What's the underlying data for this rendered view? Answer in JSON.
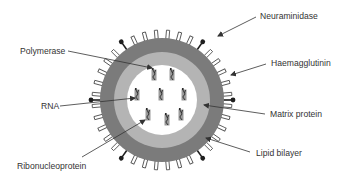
{
  "figure": {
    "colors": {
      "background": "#ffffff",
      "lipid_bilayer": "#7b7b7b",
      "matrix_protein": "#b4b4b4",
      "core": "#ffffff",
      "spike_outline": "#555555",
      "knob": "#1f1f1f",
      "rnp_box": "#9a9a9a",
      "rna_strand": "#2a2a2a",
      "arrow": "#333333",
      "text": "#333333"
    },
    "virion": {
      "cx": 162,
      "cy": 100,
      "outer_radius": 62,
      "matrix_radius": 48,
      "core_radius": 35,
      "haemagglutinin_count": 36,
      "neuraminidase_angles_deg": [
        -125,
        -55,
        0,
        55,
        125,
        180
      ]
    },
    "ribonucleoproteins": [
      {
        "x": 154,
        "y": 75
      },
      {
        "x": 172,
        "y": 75
      },
      {
        "x": 137,
        "y": 95
      },
      {
        "x": 161,
        "y": 95
      },
      {
        "x": 184,
        "y": 95
      },
      {
        "x": 148,
        "y": 115
      },
      {
        "x": 167,
        "y": 120
      },
      {
        "x": 181,
        "y": 115
      }
    ]
  },
  "labels": [
    {
      "id": "neuraminidase",
      "text": "Neuraminidase",
      "x": 260,
      "y": 11,
      "arrow": {
        "x1": 256,
        "y1": 17,
        "x2": 218,
        "y2": 36
      }
    },
    {
      "id": "polymerase",
      "text": "Polymerase",
      "x": 20,
      "y": 46,
      "arrow": {
        "x1": 68,
        "y1": 51,
        "x2": 152,
        "y2": 68
      }
    },
    {
      "id": "haemagglutinin",
      "text": "Haemagglutinin",
      "x": 271,
      "y": 58,
      "arrow": {
        "x1": 266,
        "y1": 64,
        "x2": 231,
        "y2": 75
      }
    },
    {
      "id": "rna",
      "text": "RNA",
      "x": 41,
      "y": 101,
      "arrow": {
        "x1": 60,
        "y1": 106,
        "x2": 135,
        "y2": 98
      }
    },
    {
      "id": "matrix-protein",
      "text": "Matrix protein",
      "x": 270,
      "y": 109,
      "arrow": {
        "x1": 265,
        "y1": 114,
        "x2": 204,
        "y2": 105
      }
    },
    {
      "id": "lipid-bilayer",
      "text": "Lipid bilayer",
      "x": 256,
      "y": 148,
      "arrow": {
        "x1": 250,
        "y1": 152,
        "x2": 206,
        "y2": 138
      }
    },
    {
      "id": "ribonucleoprotein",
      "text": "Ribonucleoprotein",
      "x": 17,
      "y": 161,
      "arrow": {
        "x1": 82,
        "y1": 157,
        "x2": 145,
        "y2": 120
      }
    }
  ]
}
